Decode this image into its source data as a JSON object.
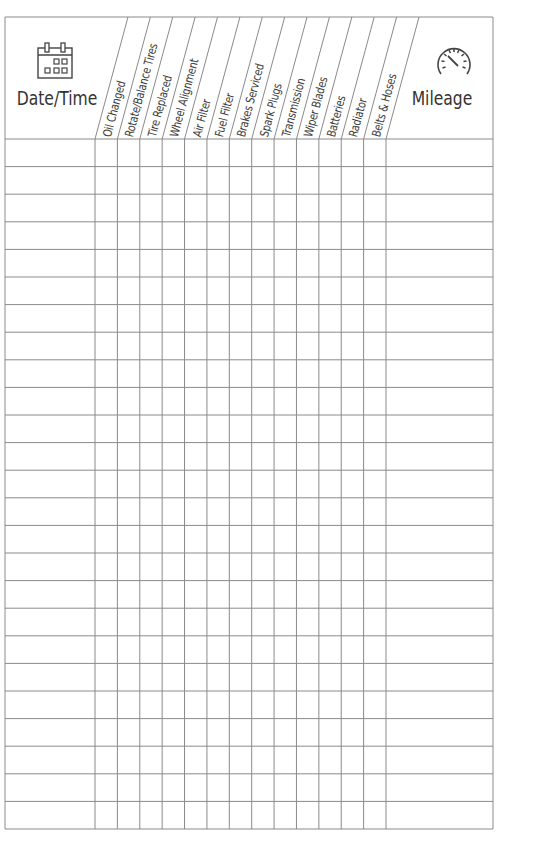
{
  "log": {
    "date_column": {
      "label": "Date/Time",
      "icon": "calendar-icon"
    },
    "mileage_column": {
      "label": "Mileage",
      "icon": "speedometer-icon"
    },
    "service_columns": [
      "Oil Changed",
      "Rotate/Balance Tires",
      "Tire Replaced",
      "Wheel Alignment",
      "Air Filter",
      "Fuel Filter",
      "Brakes Serviced",
      "Spark Plugs",
      "Transmission",
      "Wiper Blades",
      "Batteries",
      "Radiator",
      "Belts & Hoses"
    ],
    "row_count": 25
  },
  "colors": {
    "grid": "#8a8a8a",
    "text": "#333333"
  }
}
